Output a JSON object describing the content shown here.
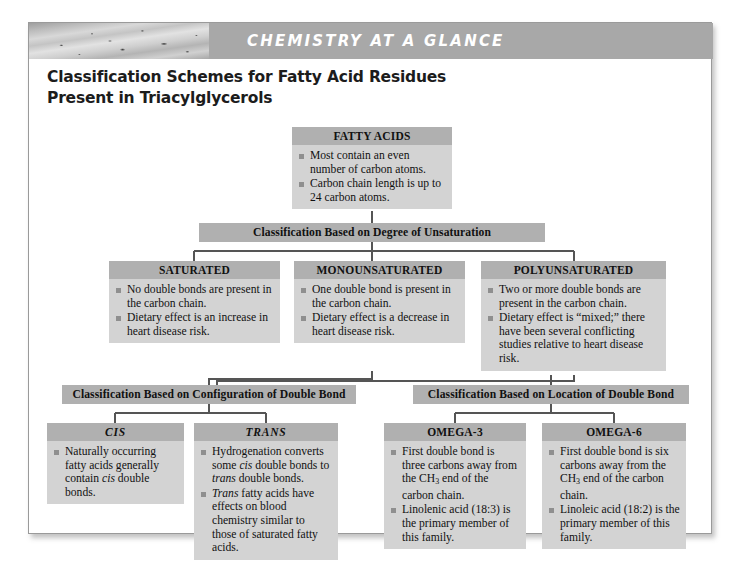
{
  "header": {
    "banner_label": "CHEMISTRY AT A GLANCE",
    "title_line1": "Classification Schemes for Fatty Acid Residues",
    "title_line2": "Present in Triacylglycerols"
  },
  "colors": {
    "node_body": "#d3d3d3",
    "node_header": "#b0b0b0",
    "bar": "#b0b0b0",
    "banner": "#a8a8a8",
    "bullet": "#8f8f8f",
    "connector": "#555555"
  },
  "nodes": {
    "fatty_acids": {
      "title": "FATTY ACIDS",
      "bullets": [
        "Most contain an even number of carbon atoms.",
        "Carbon chain length is up to 24 carbon atoms."
      ]
    },
    "saturated": {
      "title": "SATURATED",
      "bullets": [
        "No double bonds are present in the carbon chain.",
        "Dietary effect is an increase in heart disease risk."
      ]
    },
    "monounsaturated": {
      "title": "MONOUNSATURATED",
      "bullets": [
        "One double bond is present in the carbon chain.",
        "Dietary effect is a decrease in heart disease risk."
      ]
    },
    "polyunsaturated": {
      "title": "POLYUNSATURATED",
      "bullets": [
        "Two or more double bonds are present in the carbon chain.",
        "Dietary effect is “mixed;” there have been several conflicting studies relative to heart disease risk."
      ]
    },
    "cis": {
      "title": "CIS",
      "bullets_html": [
        "Naturally occurring fatty acids generally contain <i>cis</i> double bonds."
      ]
    },
    "trans": {
      "title": "TRANS",
      "bullets_html": [
        "Hydrogenation converts some <i>cis</i> double bonds to <i>trans</i> double bonds.",
        "<i>Trans</i> fatty acids have effects on blood chemistry similar to those of saturated fatty acids."
      ]
    },
    "omega3": {
      "title": "OMEGA-3",
      "bullets_html": [
        "First double bond is three carbons away from the CH<sub>3</sub> end of the carbon chain.",
        "Linolenic acid (18:3) is the primary member of this family."
      ]
    },
    "omega6": {
      "title": "OMEGA-6",
      "bullets_html": [
        "First double bond is six carbons away from the CH<sub>3</sub> end of the carbon chain.",
        "Linoleic acid (18:2) is the primary member of this family."
      ]
    }
  },
  "bars": {
    "degree": "Classification Based on Degree of Unsaturation",
    "configuration": "Classification Based on Configuration of Double Bond",
    "location": "Classification Based on Location of Double Bond"
  }
}
